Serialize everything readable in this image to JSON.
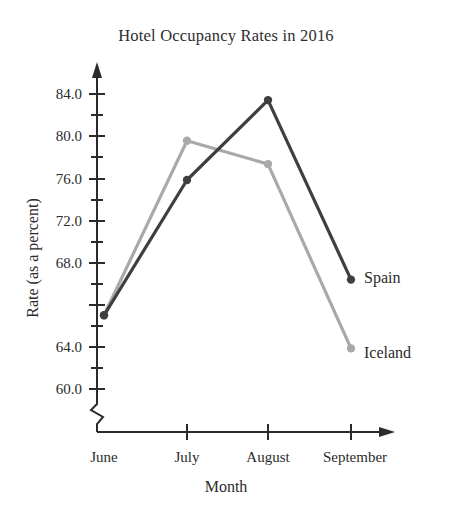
{
  "chart_data": {
    "type": "line",
    "title": "Hotel Occupancy Rates in 2016",
    "xlabel": "Month",
    "ylabel": "Rate (as a percent)",
    "categories": [
      "June",
      "July",
      "August",
      "September"
    ],
    "series": [
      {
        "name": "Spain",
        "color": "#3f3f3f",
        "values": [
          66.0,
          77.0,
          83.5,
          68.9
        ]
      },
      {
        "name": "Iceland",
        "color": "#a9a9a9",
        "values": [
          66.0,
          80.2,
          78.3,
          63.3
        ]
      }
    ],
    "ylim": [
      60.0,
      85.0
    ],
    "ytick_labels": [
      "84.0",
      "80.0",
      "76.0",
      "72.0",
      "68.0",
      "64.0",
      "60.0"
    ],
    "ytick_values": [
      84.0,
      80.0,
      76.0,
      72.0,
      68.0,
      64.0,
      60.0
    ],
    "yminor_values": [
      82.0,
      78.0,
      74.0,
      70.0,
      66.0,
      62.0
    ],
    "grid": false,
    "legend": "inline-right-of-endpoint",
    "axis_break": true
  }
}
